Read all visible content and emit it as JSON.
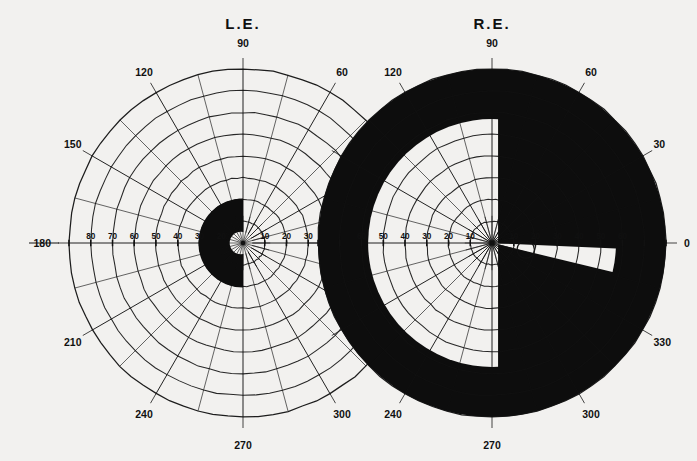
{
  "page": {
    "background_color": "#f2f1ef",
    "ink_color": "#111111",
    "type": "visual-field-perimetry-chart"
  },
  "charts": [
    {
      "id": "left-eye",
      "title": "L.E.",
      "center": {
        "x": 243,
        "y": 243
      },
      "outer_radius": 174,
      "ring_step": 21.75,
      "ring_count": 8,
      "meridian_step_deg": 15,
      "meridian_labels": [
        {
          "deg": 90,
          "text": "90"
        },
        {
          "deg": 120,
          "text": "120"
        },
        {
          "deg": 150,
          "text": "150"
        },
        {
          "deg": 180,
          "text": "180"
        },
        {
          "deg": 210,
          "text": "210"
        },
        {
          "deg": 240,
          "text": "240"
        },
        {
          "deg": 270,
          "text": "270"
        },
        {
          "deg": 300,
          "text": "300"
        },
        {
          "deg": 60,
          "text": "60"
        }
      ],
      "radial_ticks_left": [
        "80",
        "70",
        "60",
        "50",
        "40",
        "30",
        "20"
      ],
      "radial_ticks_right": [
        "10",
        "20",
        "30",
        "40",
        "50",
        "60"
      ],
      "scotoma": {
        "shape": "half-disc",
        "side": "nasal-left",
        "radius_deg": 22,
        "fill": "#0d0d0d",
        "note": "dense central half-field defect, temporal-to-left of fixation"
      }
    },
    {
      "id": "right-eye",
      "title": "R.E.",
      "center": {
        "x": 492,
        "y": 243
      },
      "outer_radius": 174,
      "ring_step": 21.75,
      "ring_count": 8,
      "meridian_step_deg": 15,
      "meridian_labels": [
        {
          "deg": 90,
          "text": "90"
        },
        {
          "deg": 120,
          "text": "120"
        },
        {
          "deg": 60,
          "text": "60"
        },
        {
          "deg": 30,
          "text": "30"
        },
        {
          "deg": 0,
          "text": "0"
        },
        {
          "deg": 330,
          "text": "330"
        },
        {
          "deg": 300,
          "text": "300"
        },
        {
          "deg": 270,
          "text": "270"
        },
        {
          "deg": 240,
          "text": "240"
        }
      ],
      "radial_ticks_left": [
        "60",
        "50",
        "40",
        "30",
        "20",
        "10"
      ],
      "radial_ticks_right": [
        "10",
        "20",
        "30",
        "40",
        "50",
        "60"
      ],
      "seeing_field": {
        "shape": "part-disc-clipped",
        "radius_deg": 57,
        "clip_right_of_deg": 5,
        "note": "residual island of vision occupying nasal half; remainder of field dense black"
      },
      "wedge": {
        "from_deg": 352,
        "to_deg": 10,
        "radius_deg": 57,
        "note": "narrow temporal wedge of preserved field along horizontal meridian"
      },
      "blind_spot": {
        "x_deg": 15,
        "y_deg": -3,
        "radius_deg": 6,
        "note": "physiological blind spot"
      },
      "scotoma": {
        "fill": "#0d0d0d"
      }
    }
  ]
}
